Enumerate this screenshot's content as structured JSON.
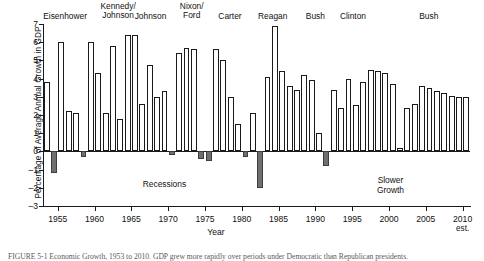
{
  "axes": {
    "ylabel": "Percentage of Average Annual Growth in GDP",
    "xlabel": "Year",
    "xtick_sub": "est."
  },
  "annotations": {
    "recessions": "Recessions",
    "slower_growth": "Slower\nGrowth"
  },
  "caption": "FIGURE 5-1   Economic Growth, 1953 to 2010. GDP grew more rapidly over periods under Democratic than Republican presidents.",
  "chart_data": {
    "type": "bar",
    "title": "",
    "xlabel": "Year",
    "ylabel": "Percentage of Average Annual Growth in GDP",
    "ylim": [
      -3,
      7
    ],
    "xlim": [
      1953,
      2010
    ],
    "yticks": [
      7,
      6,
      5,
      4,
      3,
      2,
      1,
      0,
      -1,
      -2,
      -3
    ],
    "xticks": [
      1955,
      1960,
      1965,
      1970,
      1975,
      1980,
      1985,
      1990,
      1995,
      2000,
      2005,
      2010
    ],
    "grid": false,
    "legend": null,
    "bar_colors": {
      "growth": "#ffffff",
      "recession": "#706f6f",
      "outline": "#1a1a1a"
    },
    "categories": [
      1953,
      1954,
      1955,
      1956,
      1957,
      1958,
      1959,
      1960,
      1961,
      1962,
      1963,
      1964,
      1965,
      1966,
      1967,
      1968,
      1969,
      1970,
      1971,
      1972,
      1973,
      1974,
      1975,
      1976,
      1977,
      1978,
      1979,
      1980,
      1981,
      1982,
      1983,
      1984,
      1985,
      1986,
      1987,
      1988,
      1989,
      1990,
      1991,
      1992,
      1993,
      1994,
      1995,
      1996,
      1997,
      1998,
      1999,
      2000,
      2001,
      2002,
      2003,
      2004,
      2005,
      2006,
      2007,
      2008,
      2009,
      2010
    ],
    "values": [
      3.8,
      -1.2,
      6.0,
      2.2,
      2.1,
      -0.3,
      6.0,
      4.3,
      2.1,
      5.8,
      1.8,
      6.4,
      6.4,
      2.6,
      4.75,
      3.0,
      3.3,
      -0.2,
      5.4,
      5.7,
      5.6,
      -0.4,
      -0.55,
      5.6,
      5.0,
      3.0,
      1.5,
      -0.3,
      2.1,
      -2.0,
      4.1,
      6.9,
      4.4,
      3.6,
      3.4,
      4.2,
      3.9,
      1.0,
      -0.8,
      3.4,
      2.4,
      4.0,
      2.55,
      3.8,
      4.5,
      4.4,
      4.3,
      3.7,
      0.2,
      2.4,
      2.6,
      3.6,
      3.5,
      3.3,
      3.2,
      3.05,
      3.0,
      3.0
    ],
    "recession_years": [
      1954,
      1958,
      1974,
      1975,
      1980,
      1982,
      1991
    ],
    "series": [
      {
        "name": "Average annual GDP growth (%)",
        "values": [
          3.8,
          -1.2,
          6.0,
          2.2,
          2.1,
          -0.3,
          6.0,
          4.3,
          2.1,
          5.8,
          1.8,
          6.4,
          6.4,
          2.6,
          4.75,
          3.0,
          3.3,
          -0.2,
          5.4,
          5.7,
          5.6,
          -0.4,
          -0.55,
          5.6,
          5.0,
          3.0,
          1.5,
          -0.3,
          2.1,
          -2.0,
          4.1,
          6.9,
          4.4,
          3.6,
          3.4,
          4.2,
          3.9,
          1.0,
          -0.8,
          3.4,
          2.4,
          4.0,
          2.55,
          3.8,
          4.5,
          4.4,
          4.3,
          3.7,
          0.2,
          2.4,
          2.6,
          3.6,
          3.5,
          3.3,
          3.2,
          3.05,
          3.0,
          3.0
        ]
      }
    ],
    "administrations": [
      {
        "label": "Eisenhower",
        "center_year": 1956.0
      },
      {
        "label": "Kennedy/\nJohnson",
        "center_year": 1963.2
      },
      {
        "label": "Johnson",
        "center_year": 1967.6
      },
      {
        "label": "Nixon/\nFord",
        "center_year": 1973.2
      },
      {
        "label": "Carter",
        "center_year": 1978.4
      },
      {
        "label": "Reagan",
        "center_year": 1984.2
      },
      {
        "label": "Bush",
        "center_year": 1990.0
      },
      {
        "label": "Clinton",
        "center_year": 1995.1
      },
      {
        "label": "Bush",
        "center_year": 2005.4
      }
    ]
  }
}
